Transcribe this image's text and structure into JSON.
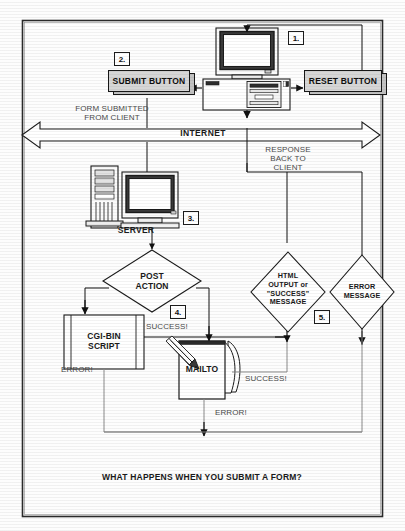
{
  "diagram": {
    "caption": "WHAT HAPPENS WHEN YOU SUBMIT A FORM?",
    "steps": [
      {
        "id": "1",
        "marker": "1."
      },
      {
        "id": "2",
        "marker": "2."
      },
      {
        "id": "3",
        "marker": "3."
      },
      {
        "id": "4",
        "marker": "4."
      },
      {
        "id": "5",
        "marker": "5."
      }
    ],
    "nodes": {
      "client_computer": {
        "name": "client-computer",
        "label": ""
      },
      "submit_button": {
        "label": "SUBMIT BUTTON"
      },
      "reset_button": {
        "label": "RESET BUTTON"
      },
      "internet_band": {
        "label": "INTERNET"
      },
      "server": {
        "label": "SERVER"
      },
      "post_action": {
        "label_line1": "POST",
        "label_line2": "ACTION"
      },
      "cgi_bin": {
        "label_line1": "CGI-BIN",
        "label_line2": "SCRIPT"
      },
      "mailto": {
        "label": "MAILTO"
      },
      "html_output": {
        "line1": "HTML",
        "line2": "OUTPUT or",
        "line3": "\"SUCCESS\"",
        "line4": "MESSAGE"
      },
      "error_message": {
        "line1": "ERROR",
        "line2": "MESSAGE"
      }
    },
    "edge_labels": {
      "form_submitted_l1": "FORM SUBMITTED",
      "form_submitted_l2": "FROM CLIENT",
      "response_l1": "RESPONSE",
      "response_l2": "BACK TO",
      "response_l3": "CLIENT",
      "cgi_success": "SUCCESS!",
      "cgi_error": "ERROR!",
      "mailto_success": "SUCCESS!",
      "mailto_error": "ERROR!"
    },
    "colors": {
      "ink": "#1a1a1a",
      "button_fill": "#d6d6d6",
      "button_shadow": "#c2c2c2",
      "paper": "#ffffff",
      "frame": "#2b2b2b",
      "label_gray": "#4a4a4a"
    }
  }
}
